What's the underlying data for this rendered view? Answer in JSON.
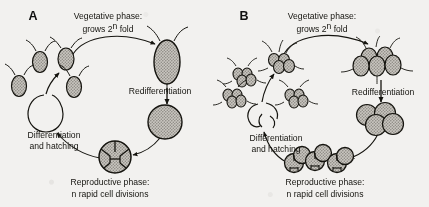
{
  "figure": {
    "background_color": "#f2f1ef",
    "ink_color": "#15140f",
    "cell_fill_color": "#b9b6b0",
    "panels": [
      {
        "letter": "A",
        "type": "unicellular",
        "labels": {
          "top_line1": "Vegetative phase:",
          "top_line2_prefix": "grows 2",
          "top_line2_sup": "n",
          "top_line2_suffix": " fold",
          "right": "Redifferentiation",
          "bottom_line1": "Reproductive phase:",
          "bottom_line2": "n rapid cell divisions",
          "left_line1": "Differentiation",
          "left_line2": "and hatching"
        },
        "stages": [
          {
            "name": "small-flagellated-cell",
            "count": 1,
            "flagella": 2,
            "shape": "oval",
            "shaded": true
          },
          {
            "name": "large-vegetative-cell",
            "count": 1,
            "flagella": 2,
            "shape": "oval",
            "shaded": true
          },
          {
            "name": "round-redifferentiated-cell",
            "count": 1,
            "flagella": 0,
            "shape": "circle",
            "shaded": true
          },
          {
            "name": "dividing-cell-four-quadrants",
            "count": 1,
            "flagella": 0,
            "shape": "circle-divided",
            "divisions": 4,
            "shaded": true
          },
          {
            "name": "hatching-empty-wall",
            "count": 1,
            "flagella": 0,
            "shape": "open-circle",
            "shaded": false
          },
          {
            "name": "released-daughter-cells",
            "count": 3,
            "flagella": 2,
            "shape": "oval",
            "shaded": true
          }
        ]
      },
      {
        "letter": "B",
        "type": "colonial",
        "labels": {
          "top_line1": "Vegetative phase:",
          "top_line2_prefix": "grows 2",
          "top_line2_sup": "n",
          "top_line2_suffix": " fold",
          "right": "Redifferentiation",
          "bottom_line1": "Reproductive phase:",
          "bottom_line2": "n rapid cell divisions",
          "left_line1": "Differentiation",
          "left_line2": "and hatching"
        },
        "stages": [
          {
            "name": "small-colony",
            "count": 1,
            "cells_per_colony": 4,
            "flagella": 8,
            "shape": "cluster",
            "shaded": true
          },
          {
            "name": "large-vegetative-colony",
            "count": 1,
            "cells_per_colony": 5,
            "flagella": 8,
            "shape": "cluster",
            "shaded": true
          },
          {
            "name": "round-redifferentiated-colony",
            "count": 1,
            "cells_per_colony": 4,
            "flagella": 0,
            "shape": "cluster",
            "shaded": true
          },
          {
            "name": "dividing-colony",
            "count": 3,
            "cells_per_colony": 4,
            "flagella": 0,
            "shape": "cluster-divided",
            "shaded": true
          },
          {
            "name": "hatching-empty-wall",
            "count": 1,
            "flagella": 0,
            "shape": "open-cluster",
            "shaded": false
          },
          {
            "name": "released-daughter-colonies",
            "count": 3,
            "cells_per_colony": 4,
            "flagella": 8,
            "shape": "cluster",
            "shaded": true
          }
        ]
      }
    ],
    "arrows": [
      {
        "name": "arrow-to-large-cell",
        "direction": "clockwise",
        "from": "small-cell",
        "to": "large-vegetative"
      },
      {
        "name": "arrow-redifferentiation",
        "direction": "down",
        "from": "large-vegetative",
        "to": "round-cell"
      },
      {
        "name": "arrow-to-dividing",
        "direction": "counterclockwise",
        "from": "round-cell",
        "to": "dividing-cell"
      },
      {
        "name": "arrow-differentiation-hatching",
        "direction": "up-left",
        "from": "dividing-cell",
        "to": "empty-wall"
      },
      {
        "name": "arrow-to-small-cell",
        "direction": "up-right",
        "from": "released-cells",
        "to": "small-cell"
      }
    ]
  }
}
